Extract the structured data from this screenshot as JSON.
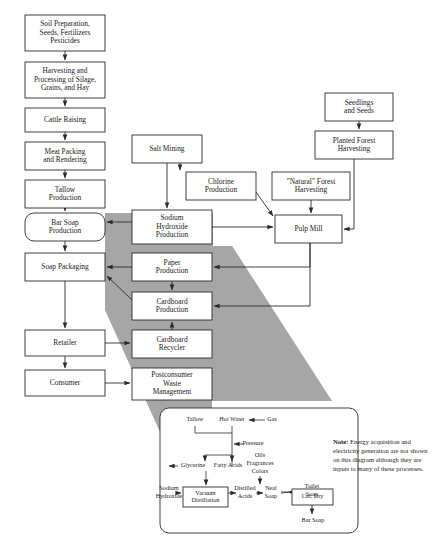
{
  "diagram": {
    "colors": {
      "wedge": "#a6a6a6",
      "stroke": "#2b2b2b",
      "box_fill": "#ffffff"
    },
    "nodes": [
      {
        "id": "soil",
        "label": "Soil Preparation,\nSeeds, Fertilizers\nPesticides",
        "x": 25,
        "y": 15,
        "w": 80,
        "h": 36,
        "shape": "rect"
      },
      {
        "id": "harvest",
        "label": "Harvesting and\nProcessing of Silage,\nGrains, and Hay",
        "x": 25,
        "y": 62,
        "w": 80,
        "h": 36,
        "shape": "rect"
      },
      {
        "id": "cattle",
        "label": "Cattle Raising",
        "x": 25,
        "y": 108,
        "w": 80,
        "h": 24,
        "shape": "rect"
      },
      {
        "id": "meat",
        "label": "Meat Packing\nand Rendering",
        "x": 25,
        "y": 142,
        "w": 80,
        "h": 28,
        "shape": "rect"
      },
      {
        "id": "tallow",
        "label": "Tallow\nProduction",
        "x": 25,
        "y": 180,
        "w": 80,
        "h": 28,
        "shape": "rect"
      },
      {
        "id": "barsoap",
        "label": "Bar Soap\nProduction",
        "x": 25,
        "y": 213,
        "w": 80,
        "h": 28,
        "shape": "round"
      },
      {
        "id": "soappack",
        "label": "Soap Packaging",
        "x": 25,
        "y": 253,
        "w": 80,
        "h": 28,
        "shape": "rect"
      },
      {
        "id": "retailer",
        "label": "Retailer",
        "x": 25,
        "y": 330,
        "w": 80,
        "h": 26,
        "shape": "rect"
      },
      {
        "id": "consumer",
        "label": "Consumer",
        "x": 25,
        "y": 370,
        "w": 80,
        "h": 26,
        "shape": "rect"
      },
      {
        "id": "salt",
        "label": "Salt Mining",
        "x": 132,
        "y": 135,
        "w": 70,
        "h": 28,
        "shape": "rect"
      },
      {
        "id": "chlorine",
        "label": "Chlorine\nProduction",
        "x": 186,
        "y": 172,
        "w": 70,
        "h": 28,
        "shape": "rect"
      },
      {
        "id": "naoh",
        "label": "Sodium\nHydroxide\nProduction",
        "x": 132,
        "y": 210,
        "w": 80,
        "h": 34,
        "shape": "rect"
      },
      {
        "id": "paper",
        "label": "Paper\nProduction",
        "x": 132,
        "y": 253,
        "w": 80,
        "h": 28,
        "shape": "rect"
      },
      {
        "id": "cardboard",
        "label": "Cardboard\nProduction",
        "x": 132,
        "y": 292,
        "w": 80,
        "h": 28,
        "shape": "rect"
      },
      {
        "id": "cbrecycler",
        "label": "Cardboard\nRecycler",
        "x": 132,
        "y": 330,
        "w": 80,
        "h": 28,
        "shape": "rect"
      },
      {
        "id": "postconsumer",
        "label": "Postconsumer\nWaste\nManagement",
        "x": 132,
        "y": 368,
        "w": 80,
        "h": 32,
        "shape": "rect"
      },
      {
        "id": "seedlings",
        "label": "Seedlings\nand Seeds",
        "x": 325,
        "y": 93,
        "w": 68,
        "h": 28,
        "shape": "rect"
      },
      {
        "id": "planted",
        "label": "Planted Forest\nHarvesting",
        "x": 315,
        "y": 131,
        "w": 78,
        "h": 28,
        "shape": "rect"
      },
      {
        "id": "natural",
        "label": "\"Natural\" Forest\nHarvesting",
        "x": 272,
        "y": 172,
        "w": 78,
        "h": 28,
        "shape": "rect"
      },
      {
        "id": "pulpmill",
        "label": "Pulp Mill",
        "x": 275,
        "y": 215,
        "w": 67,
        "h": 28,
        "shape": "rect"
      }
    ],
    "inset": {
      "x": 160,
      "y": 408,
      "w": 198,
      "h": 125,
      "nodes": [
        {
          "id": "vacuum",
          "label": "Vacuum\nDistillation",
          "x": 183,
          "y": 487,
          "w": 45,
          "h": 20,
          "shape": "rect"
        },
        {
          "id": "cutdry",
          "label": "Cut, Dry",
          "x": 292,
          "y": 489,
          "w": 41,
          "h": 16,
          "shape": "rect"
        }
      ],
      "labels": [
        {
          "id": "tallow-in",
          "text": "Tallow",
          "x": 195,
          "y": 420
        },
        {
          "id": "hotwater",
          "text": "Hot Water",
          "x": 232,
          "y": 420
        },
        {
          "id": "gas",
          "text": "Gas",
          "x": 272,
          "y": 420
        },
        {
          "id": "pressure",
          "text": "Pressure",
          "x": 253,
          "y": 444
        },
        {
          "id": "glycerine",
          "text": "Glycerine",
          "x": 193,
          "y": 466
        },
        {
          "id": "fattyacids",
          "text": "Fatty Acids",
          "x": 228,
          "y": 466
        },
        {
          "id": "oils",
          "text": "Oils",
          "x": 260,
          "y": 456
        },
        {
          "id": "fragrances",
          "text": "Fragrances",
          "x": 260,
          "y": 464
        },
        {
          "id": "colors",
          "text": "Colors",
          "x": 260,
          "y": 472
        },
        {
          "id": "naoh-in-1",
          "text": "Sodium",
          "x": 169,
          "y": 489
        },
        {
          "id": "naoh-in-2",
          "text": "Hydroxide",
          "x": 169,
          "y": 497
        },
        {
          "id": "distilled1",
          "text": "Distilled",
          "x": 245,
          "y": 489
        },
        {
          "id": "distilled2",
          "text": "Acids",
          "x": 245,
          "y": 497
        },
        {
          "id": "neat1",
          "text": "Neal",
          "x": 271,
          "y": 489
        },
        {
          "id": "neat2",
          "text": "Soap",
          "x": 271,
          "y": 497
        },
        {
          "id": "toilet1",
          "text": "Toilet",
          "x": 312,
          "y": 487
        },
        {
          "id": "toilet2",
          "text": "Soap",
          "x": 312,
          "y": 495
        },
        {
          "id": "barsoap-out",
          "text": "Bar Soap",
          "x": 313,
          "y": 521
        }
      ]
    },
    "note": {
      "bold_prefix": "Note:",
      "text": " Energy acquisition and electricity generation are not shown on this diagram although they are inputs to many of these processes."
    }
  }
}
